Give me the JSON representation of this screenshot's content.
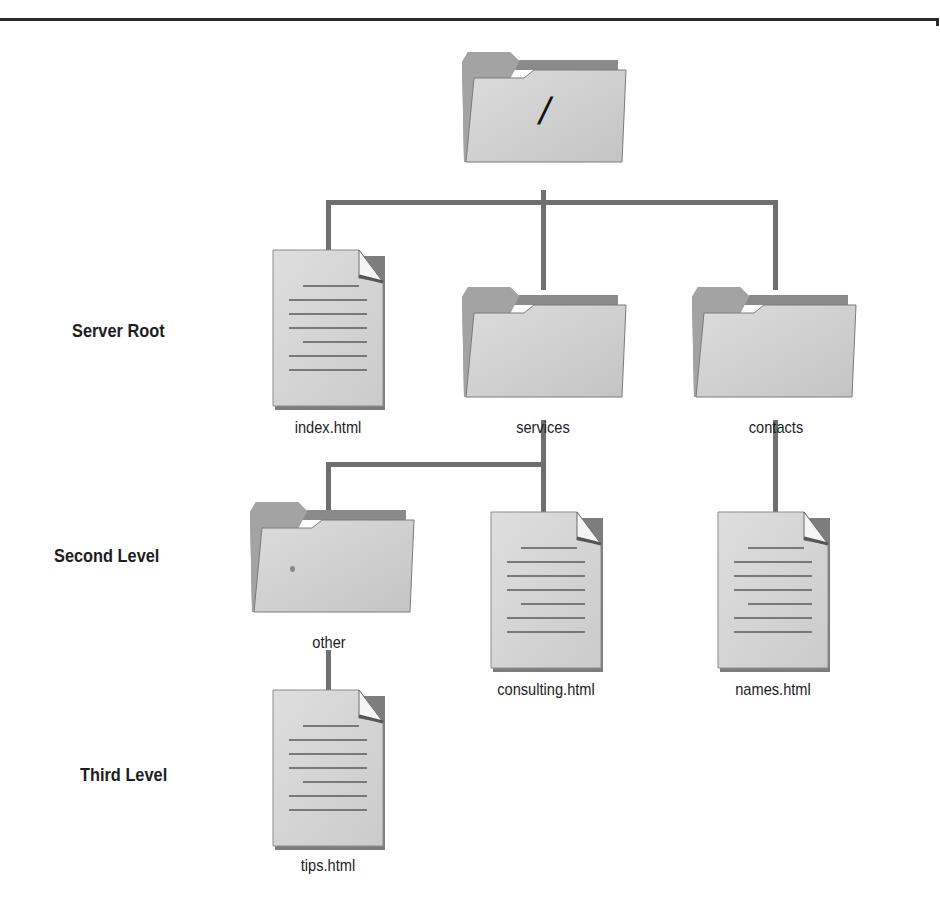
{
  "diagram": {
    "type": "directory-tree",
    "levels": [
      {
        "label": "Server Root"
      },
      {
        "label": "Second Level"
      },
      {
        "label": "Third Level"
      }
    ],
    "root": {
      "icon": "folder-icon",
      "label": "/"
    },
    "nodes": [
      {
        "id": "index",
        "icon": "document-icon",
        "label": "index.html",
        "parent": "/"
      },
      {
        "id": "services",
        "icon": "folder-icon",
        "label": "services",
        "parent": "/"
      },
      {
        "id": "contacts",
        "icon": "folder-icon",
        "label": "contacts",
        "parent": "/"
      },
      {
        "id": "other",
        "icon": "folder-icon",
        "label": "other",
        "parent": "services"
      },
      {
        "id": "consulting",
        "icon": "document-icon",
        "label": "consulting.html",
        "parent": "services"
      },
      {
        "id": "names",
        "icon": "document-icon",
        "label": "names.html",
        "parent": "contacts"
      },
      {
        "id": "tips",
        "icon": "document-icon",
        "label": "tips.html",
        "parent": "other"
      }
    ],
    "colors": {
      "connector": "#6f6f6f",
      "folder_body": "#d4d4d4",
      "folder_back": "#8a8a8a",
      "document": "#d6d6d6",
      "text": "#1e1e1e"
    }
  }
}
